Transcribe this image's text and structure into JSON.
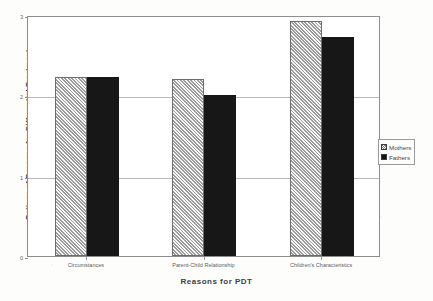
{
  "chart_data": {
    "type": "bar",
    "title": "",
    "xlabel": "Reasons for PDT",
    "ylabel": "Ratings of Reasons for Differential Treatment",
    "categories": [
      "Circumstances",
      "Parent-Child Relationship",
      "Children's Characteristics"
    ],
    "series": [
      {
        "name": "Mothers",
        "values": [
          2.23,
          2.2,
          2.93
        ],
        "color": "#c9c9c9",
        "pattern": "diagonal-hatch"
      },
      {
        "name": "Fathers",
        "values": [
          2.23,
          2.0,
          2.73
        ],
        "color": "#171717",
        "pattern": "solid"
      }
    ],
    "ylim": [
      0,
      3
    ],
    "yticks": [
      0,
      1,
      2,
      3
    ],
    "ytick_labels": [
      "0",
      "1",
      "2",
      "3"
    ],
    "grid": true,
    "legend_position": "right"
  },
  "legend": {
    "entries": [
      {
        "label": "Mothers"
      },
      {
        "label": "Fathers"
      }
    ]
  }
}
